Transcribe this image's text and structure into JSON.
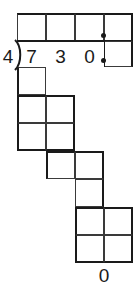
{
  "worksheet": {
    "type": "long-division-grid",
    "title": "Long division worksheet",
    "problem": {
      "divisor": "4",
      "dividend_digits": [
        "7",
        "3",
        "0"
      ],
      "dividend_decimal_point": ".",
      "dividend_text": "730.",
      "bracket_symbol": ")"
    },
    "quotient_row": {
      "label": "quotient",
      "cells": [
        "",
        "",
        "",
        ""
      ],
      "decimal_dot": true
    },
    "work_rows": [
      {
        "label": "work-row-1",
        "cells": [
          "",
          ""
        ]
      },
      {
        "label": "work-row-2",
        "cells": [
          "",
          ""
        ]
      },
      {
        "label": "work-row-3",
        "cells": [
          "",
          ""
        ]
      },
      {
        "label": "work-row-4",
        "cells": [
          "",
          ""
        ]
      },
      {
        "label": "work-row-5",
        "cells": [
          "",
          ""
        ]
      }
    ],
    "footer": {
      "remainder": "0"
    },
    "colors": {
      "grid_line": "#3a3a3a",
      "emphasis_line": "#1a1a1a",
      "ink": "#1a1a1a",
      "paper": "#ffffff"
    }
  }
}
